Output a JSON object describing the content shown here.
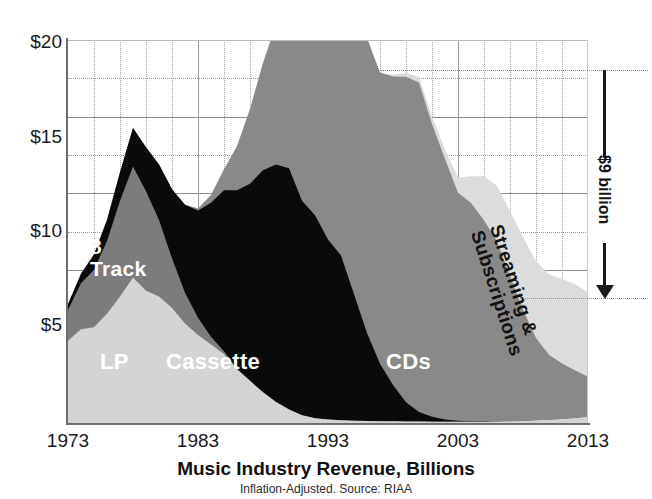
{
  "chart_data": {
    "type": "area",
    "title": "Music Industry Revenue, Billions",
    "subtitle": "Inflation-Adjusted. Source: RIAA",
    "xlabel": "",
    "ylabel": "",
    "xlim": [
      1973,
      2013
    ],
    "ylim": [
      0,
      20
    ],
    "grid": true,
    "legend_position": "inline-labels",
    "y_ticks": [
      "$20",
      "$15",
      "$10",
      "$5"
    ],
    "y_tick_values": [
      20,
      15,
      10,
      5
    ],
    "x_ticks": [
      "1973",
      "1983",
      "1993",
      "2003",
      "2013"
    ],
    "x_tick_values": [
      1973,
      1983,
      1993,
      2003,
      2013
    ],
    "x": [
      1973,
      1974,
      1975,
      1976,
      1977,
      1978,
      1979,
      1980,
      1981,
      1982,
      1983,
      1984,
      1985,
      1986,
      1987,
      1988,
      1989,
      1990,
      1991,
      1992,
      1993,
      1994,
      1995,
      1996,
      1997,
      1998,
      1999,
      2000,
      2001,
      2002,
      2003,
      2004,
      2005,
      2006,
      2007,
      2008,
      2009,
      2010,
      2011,
      2012,
      2013
    ],
    "series": [
      {
        "name": "LP",
        "color": "#d4d4d4",
        "values": [
          4.3,
          4.9,
          5.0,
          5.7,
          6.6,
          7.6,
          6.9,
          6.6,
          6.0,
          5.2,
          4.6,
          4.1,
          3.6,
          2.8,
          2.2,
          1.6,
          1.1,
          0.7,
          0.4,
          0.25,
          0.18,
          0.15,
          0.12,
          0.1,
          0.09,
          0.09,
          0.08,
          0.08,
          0.07,
          0.06,
          0.06,
          0.06,
          0.07,
          0.08,
          0.09,
          0.11,
          0.14,
          0.17,
          0.21,
          0.26,
          0.32
        ]
      },
      {
        "name": "8 Track",
        "color": "#7c7c7c",
        "values": [
          1.6,
          2.4,
          3.0,
          3.8,
          5.0,
          5.8,
          5.2,
          4.0,
          2.6,
          1.6,
          0.9,
          0.4,
          0.15,
          0.05,
          0.0,
          0.0,
          0.0,
          0.0,
          0.0,
          0.0,
          0.0,
          0.0,
          0.0,
          0.0,
          0.0,
          0.0,
          0.0,
          0.0,
          0.0,
          0.0,
          0.0,
          0.0,
          0.0,
          0.0,
          0.0,
          0.0,
          0.0,
          0.0,
          0.0,
          0.0,
          0.0
        ]
      },
      {
        "name": "Cassette",
        "color": "#0a0a0a",
        "values": [
          0.3,
          0.5,
          0.8,
          1.1,
          1.5,
          2.0,
          2.3,
          2.9,
          3.6,
          4.6,
          5.6,
          7.0,
          8.4,
          9.3,
          10.3,
          11.6,
          12.4,
          12.6,
          11.2,
          10.6,
          9.4,
          8.6,
          6.6,
          4.6,
          3.0,
          1.9,
          1.0,
          0.5,
          0.25,
          0.12,
          0.06,
          0.03,
          0.02,
          0.01,
          0.0,
          0.0,
          0.0,
          0.0,
          0.0,
          0.0,
          0.0
        ]
      },
      {
        "name": "CDs",
        "color": "#898989",
        "values": [
          0.0,
          0.0,
          0.0,
          0.0,
          0.0,
          0.0,
          0.0,
          0.0,
          0.0,
          0.0,
          0.1,
          0.4,
          1.1,
          2.3,
          3.9,
          5.6,
          7.3,
          9.2,
          10.6,
          11.8,
          12.9,
          14.4,
          15.1,
          15.4,
          15.2,
          16.1,
          17.0,
          17.2,
          15.3,
          13.6,
          11.9,
          11.4,
          10.5,
          9.4,
          7.6,
          5.8,
          4.3,
          3.4,
          2.9,
          2.5,
          2.1
        ]
      },
      {
        "name": "Streaming & Subscriptions",
        "color": "#dcdcdc",
        "values": [
          0.0,
          0.0,
          0.0,
          0.0,
          0.0,
          0.0,
          0.0,
          0.0,
          0.0,
          0.0,
          0.0,
          0.0,
          0.0,
          0.0,
          0.0,
          0.0,
          0.0,
          0.0,
          0.0,
          0.0,
          0.0,
          0.0,
          0.0,
          0.0,
          0.0,
          0.1,
          0.2,
          0.3,
          0.4,
          0.5,
          0.8,
          1.4,
          2.3,
          2.9,
          3.4,
          3.8,
          4.0,
          4.2,
          4.4,
          4.5,
          4.4
        ]
      }
    ],
    "totals": [
      6.2,
      7.8,
      8.8,
      10.6,
      13.1,
      15.4,
      14.4,
      13.5,
      12.3,
      11.4,
      11.2,
      11.9,
      13.25,
      14.45,
      16.4,
      18.8,
      20.8,
      22.5,
      22.2,
      22.65,
      22.48,
      23.15,
      21.82,
      20.1,
      18.29,
      18.19,
      18.28,
      18.08,
      16.02,
      14.28,
      12.82,
      12.89,
      12.89,
      12.39,
      11.09,
      9.71,
      8.44,
      7.77,
      7.51,
      7.26,
      6.82
    ],
    "annotation": {
      "label": "$9 billion",
      "from_value": 18.5,
      "to_value": 6.6,
      "arrow_direction": "down"
    },
    "inline_labels": [
      {
        "key": "eight_track",
        "text": "8\nTrack",
        "style": "white"
      },
      {
        "key": "lp",
        "text": "LP",
        "style": "white"
      },
      {
        "key": "cassette",
        "text": "Cassette",
        "style": "white"
      },
      {
        "key": "cds",
        "text": "CDs",
        "style": "white"
      },
      {
        "key": "streaming",
        "text": "Streaming &\nSubscriptions",
        "style": "dark"
      }
    ]
  },
  "axis": {
    "y_labels": [
      "$20",
      "$15",
      "$10",
      "$5"
    ],
    "x_labels": [
      "1973",
      "1983",
      "1993",
      "2003",
      "2013"
    ]
  },
  "labels": {
    "eight_track": "8\nTrack",
    "lp": "LP",
    "cassette": "Cassette",
    "cds": "CDs",
    "streaming": "Streaming &\nSubscriptions",
    "annotation": "$9 billion"
  },
  "footer": {
    "title": "Music Industry Revenue, Billions",
    "subtitle": "Inflation-Adjusted. Source: RIAA"
  },
  "colors": {
    "lp": "#d4d4d4",
    "eight_track": "#7c7c7c",
    "cassette": "#0a0a0a",
    "cds": "#898989",
    "streaming": "#dcdcdc",
    "axis": "#6d6d6d",
    "grid": "#9a9a9a",
    "text": "#111111"
  }
}
